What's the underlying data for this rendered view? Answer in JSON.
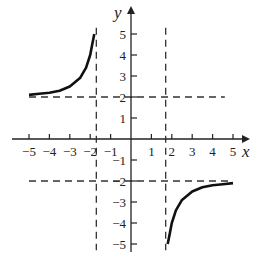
{
  "chart_data": {
    "type": "line",
    "title": "",
    "xlabel": "x",
    "ylabel": "y",
    "xlim": [
      -5,
      5
    ],
    "ylim": [
      -5,
      5
    ],
    "grid": false,
    "x_ticks": [
      -5,
      -4,
      -3,
      -2,
      -1,
      1,
      2,
      3,
      4,
      5
    ],
    "x_tick_labels": [
      "−5",
      "−4",
      "−3",
      "−2",
      "−1",
      "1",
      "2",
      "3",
      "4",
      "5"
    ],
    "y_ticks": [
      5,
      4,
      3,
      2,
      1,
      -1,
      -2,
      -3,
      -4,
      -5
    ],
    "y_tick_labels": [
      "5",
      "4",
      "3",
      "2",
      "1",
      "−1",
      "−2",
      "−3",
      "−4",
      "−5"
    ],
    "asymptotes": {
      "vertical": [
        -1.7,
        1.7
      ],
      "horizontal": [
        2,
        -2
      ],
      "style": "dashed"
    },
    "series": [
      {
        "name": "left branch",
        "x": [
          -5,
          -4.5,
          -4,
          -3.5,
          -3,
          -2.5,
          -2.2,
          -2,
          -1.9,
          -1.8
        ],
        "y": [
          2.1,
          2.15,
          2.2,
          2.3,
          2.5,
          2.9,
          3.4,
          4.0,
          4.5,
          5.0
        ]
      },
      {
        "name": "right branch",
        "x": [
          1.8,
          1.9,
          2,
          2.2,
          2.5,
          3,
          3.5,
          4,
          4.5,
          5
        ],
        "y": [
          -5.0,
          -4.5,
          -4.0,
          -3.4,
          -2.9,
          -2.5,
          -2.3,
          -2.2,
          -2.15,
          -2.1
        ]
      }
    ]
  }
}
